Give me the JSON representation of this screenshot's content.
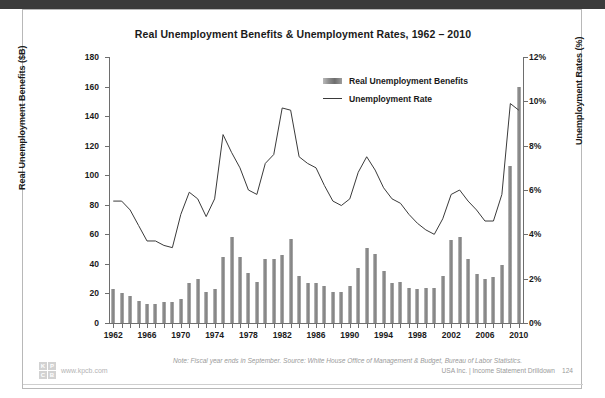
{
  "slide": {
    "page_number": "124",
    "footer_note": "Note: Fiscal year ends in September. Source: White House Office of Management & Budget, Bureau of Labor Statistics.",
    "footer_source_right": "USA Inc. | Income Statement Drilldown",
    "brand_url": "www.kpcb.com",
    "brand_letters": [
      "K",
      "P",
      "C",
      "B"
    ]
  },
  "colors": {
    "bar": "#7d7d7d",
    "line": "#3a3a3a",
    "axis": "#6e6e6e",
    "text": "#1a1a1a",
    "footer_text": "#9a9a9a",
    "card_border": "#b8b8b8",
    "top_band": "#3b3b3b"
  },
  "chart_data": {
    "type": "bar",
    "title": "Real Unemployment Benefits & Unemployment Rates, 1962 – 2010",
    "xlabel": "",
    "ylabel": "Real Unemployment Benefits ($B)",
    "y2label": "Unemployment Rates (%)",
    "ylim": [
      0,
      180
    ],
    "y2lim": [
      0,
      12
    ],
    "yticks": [
      0,
      20,
      40,
      60,
      80,
      100,
      120,
      140,
      160,
      180
    ],
    "ytick_labels": [
      "0",
      "20",
      "40",
      "60",
      "80",
      "100",
      "120",
      "140",
      "160",
      "180"
    ],
    "y2ticks": [
      0,
      2,
      4,
      6,
      8,
      10,
      12
    ],
    "y2tick_labels": [
      "0%",
      "2%",
      "4%",
      "6%",
      "8%",
      "10%",
      "12%"
    ],
    "grid": false,
    "legend_position": "top-center",
    "legend": [
      "Real Unemployment Benefits",
      "Unemployment Rate"
    ],
    "x": [
      1962,
      1963,
      1964,
      1965,
      1966,
      1967,
      1968,
      1969,
      1970,
      1971,
      1972,
      1973,
      1974,
      1975,
      1976,
      1977,
      1978,
      1979,
      1980,
      1981,
      1982,
      1983,
      1984,
      1985,
      1986,
      1987,
      1988,
      1989,
      1990,
      1991,
      1992,
      1993,
      1994,
      1995,
      1996,
      1997,
      1998,
      1999,
      2000,
      2001,
      2002,
      2003,
      2004,
      2005,
      2006,
      2007,
      2008,
      2009,
      2010
    ],
    "xtick_labels": [
      "1962",
      "1966",
      "1970",
      "1974",
      "1978",
      "1982",
      "1986",
      "1990",
      "1994",
      "1998",
      "2002",
      "2006",
      "2010"
    ],
    "xtick_values": [
      1962,
      1966,
      1970,
      1974,
      1978,
      1982,
      1986,
      1990,
      1994,
      1998,
      2002,
      2006,
      2010
    ],
    "series": [
      {
        "name": "Real Unemployment Benefits",
        "type": "bar",
        "axis": "left",
        "unit": "$B",
        "values": [
          23,
          20,
          18,
          15,
          13,
          13,
          14,
          14,
          16,
          27,
          30,
          21,
          23,
          45,
          58,
          45,
          34,
          28,
          43,
          43,
          46,
          57,
          32,
          27,
          27,
          25,
          21,
          21,
          25,
          37,
          51,
          47,
          35,
          27,
          28,
          24,
          23,
          24,
          24,
          32,
          56,
          58,
          43,
          33,
          30,
          31,
          39,
          106,
          160
        ]
      },
      {
        "name": "Unemployment Rate",
        "type": "line",
        "axis": "right",
        "unit": "%",
        "values": [
          5.5,
          5.5,
          5.1,
          4.4,
          3.7,
          3.7,
          3.5,
          3.4,
          4.9,
          5.9,
          5.6,
          4.8,
          5.6,
          8.5,
          7.7,
          7.0,
          6.0,
          5.8,
          7.2,
          7.6,
          9.7,
          9.6,
          7.5,
          7.2,
          7.0,
          6.2,
          5.5,
          5.3,
          5.6,
          6.8,
          7.5,
          6.9,
          6.1,
          5.6,
          5.4,
          4.9,
          4.5,
          4.2,
          4.0,
          4.7,
          5.8,
          6.0,
          5.5,
          5.1,
          4.6,
          4.6,
          5.8,
          9.9,
          9.6
        ]
      }
    ]
  }
}
